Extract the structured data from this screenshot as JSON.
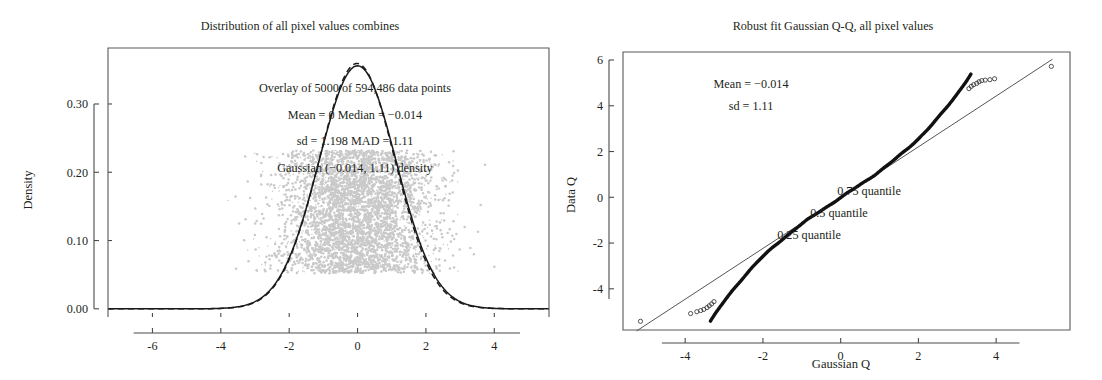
{
  "figure": {
    "width": 1102,
    "height": 380,
    "background": "#ffffff",
    "ink_color": "#231f20",
    "scatter_color": "#c9c9c9"
  },
  "chart_data": [
    {
      "id": "density-panel",
      "type": "line",
      "title": "Distribution of all pixel values combines",
      "xlabel": "",
      "ylabel": "Density",
      "xlim": [
        -7.3,
        5.6
      ],
      "ylim": [
        -0.012,
        0.382
      ],
      "xticks": [
        -6,
        -4,
        -2,
        0,
        2,
        4
      ],
      "xticklabels": [
        "-6",
        "-4",
        "-2",
        "0",
        "2",
        "4"
      ],
      "yticks": [
        0.0,
        0.1,
        0.2,
        0.3
      ],
      "yticklabels": [
        "0.00",
        "0.10",
        "0.20",
        "0.30"
      ],
      "grid": false,
      "legend": "none",
      "annotations": [
        "Overlay of 5000 of 594,486 data points",
        "Mean = 0   Median = −0.014",
        "sd = 1.198 MAD = 1.11",
        "Gaussian (−0.014, 1.11) density"
      ],
      "series": [
        {
          "name": "empirical density",
          "style": "solid",
          "mean": 0.0,
          "sd": 1.13,
          "peak": 0.356
        },
        {
          "name": "Gaussian (-0.014, 1.11) density",
          "style": "dashed",
          "mean": -0.014,
          "sd": 1.11,
          "peak": 0.3594
        }
      ],
      "overlay_scatter": {
        "name": "jittered pixel values",
        "n_shown": 5000,
        "n_total": 594486,
        "x_spread_sd": 1.2,
        "y_band": [
          0.052,
          0.232
        ],
        "color": "#c9c9c9"
      },
      "statistics": {
        "mean": 0,
        "median": -0.014,
        "sd": 1.198,
        "mad": 1.11,
        "points_overlaid": 5000,
        "points_total": 594486
      }
    },
    {
      "id": "qq-panel",
      "type": "scatter",
      "title": "Robust fit Gaussian Q-Q, all pixel values",
      "xlabel": "Gaussian Q",
      "ylabel": "Data Q",
      "xlim": [
        -5.6,
        5.9
      ],
      "ylim": [
        -5.8,
        6.35
      ],
      "xticks": [
        -4,
        -2,
        0,
        2,
        4
      ],
      "xticklabels": [
        "-4",
        "-2",
        "0",
        "2",
        "4"
      ],
      "yticks": [
        -4,
        -2,
        0,
        2,
        4,
        6
      ],
      "yticklabels": [
        "-4",
        "-2",
        "0",
        "2",
        "4",
        "6"
      ],
      "grid": false,
      "legend": "none",
      "annotations": [
        "Mean = −0.014",
        "sd = 1.11"
      ],
      "quantile_labels": [
        "0.75 quantile",
        "0.5 quantile",
        "0.25 quantile"
      ],
      "reference_line": {
        "name": "robust fit line",
        "intercept": -0.014,
        "slope": 1.11,
        "x_from": -5.25,
        "x_to": 5.45
      },
      "statistics": {
        "mean": -0.014,
        "sd": 1.11
      },
      "points_note": "heavy-tailed S-curve: data quantiles exceed the fit line at both extremes"
    }
  ],
  "panels": {
    "left": {
      "title": "Distribution of all pixel values combines",
      "y_axis_title": "Density",
      "x_tick_labels": [
        "-6",
        "-4",
        "-2",
        "0",
        "2",
        "4"
      ],
      "y_tick_labels": [
        "0.00",
        "0.10",
        "0.20",
        "0.30"
      ],
      "annotation_lines": [
        "Overlay of 5000 of 594,486 data points",
        "Mean = 0   Median = −0.014",
        "sd = 1.198 MAD = 1.11",
        "Gaussian (−0.014, 1.11) density"
      ]
    },
    "right": {
      "title": "Robust fit Gaussian Q-Q, all pixel values",
      "y_axis_title": "Data Q",
      "x_axis_title": "Gaussian Q",
      "x_tick_labels": [
        "-4",
        "-2",
        "0",
        "2",
        "4"
      ],
      "y_tick_labels": [
        "-4",
        "-2",
        "0",
        "2",
        "4",
        "6"
      ],
      "annotation_lines": [
        "Mean = −0.014",
        "sd = 1.11"
      ],
      "quantile_annotations": [
        "0.75 quantile",
        "0.5 quantile",
        "0.25 quantile"
      ]
    }
  }
}
